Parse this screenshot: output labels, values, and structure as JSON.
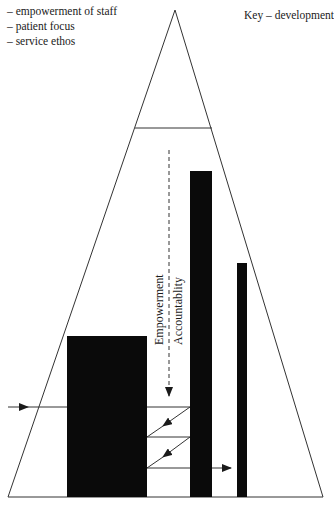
{
  "legend": {
    "items": [
      "– empowerment of staff",
      "– patient focus",
      "– service ethos"
    ]
  },
  "key": {
    "label": "Key – development"
  },
  "diagram": {
    "type": "triangle-pyramid",
    "labels": {
      "empowerment": "Empowerment",
      "accountability": "Accountablity"
    },
    "colors": {
      "line": "#333333",
      "fill_block": "#0a0a0a",
      "background": "#ffffff"
    },
    "bars": [
      {
        "name": "left-block",
        "x": 67,
        "y": 336,
        "width": 80,
        "height": 161
      },
      {
        "name": "tall-bar",
        "x": 190,
        "y": 171,
        "width": 22,
        "height": 326
      },
      {
        "name": "thin-bar",
        "x": 237,
        "y": 263,
        "width": 10,
        "height": 234
      }
    ]
  }
}
